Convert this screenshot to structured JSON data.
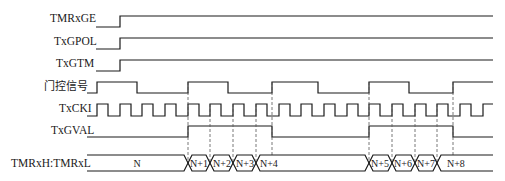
{
  "diagram": {
    "type": "timing-diagram",
    "signals": [
      {
        "name": "TMRxGE",
        "label": "TMRxGE"
      },
      {
        "name": "TxGPOL",
        "label": "TxGPOL"
      },
      {
        "name": "TxGTM",
        "label": "TxGTM"
      },
      {
        "name": "gate-signal",
        "label": "门控信号"
      },
      {
        "name": "TxCKI",
        "label": "TxCKI"
      },
      {
        "name": "TxGVAL",
        "label": "TxGVAL"
      },
      {
        "name": "counter-bus",
        "label": "TMRxH:TMRxL"
      }
    ],
    "bus_values": [
      "N",
      "N+1",
      "N+2",
      "N+3",
      "N+4",
      "N+5",
      "N+6",
      "N+7",
      "N+8"
    ],
    "colors": {
      "line": "#1a1a1a",
      "dashed": "#555555",
      "background": "#ffffff"
    }
  }
}
